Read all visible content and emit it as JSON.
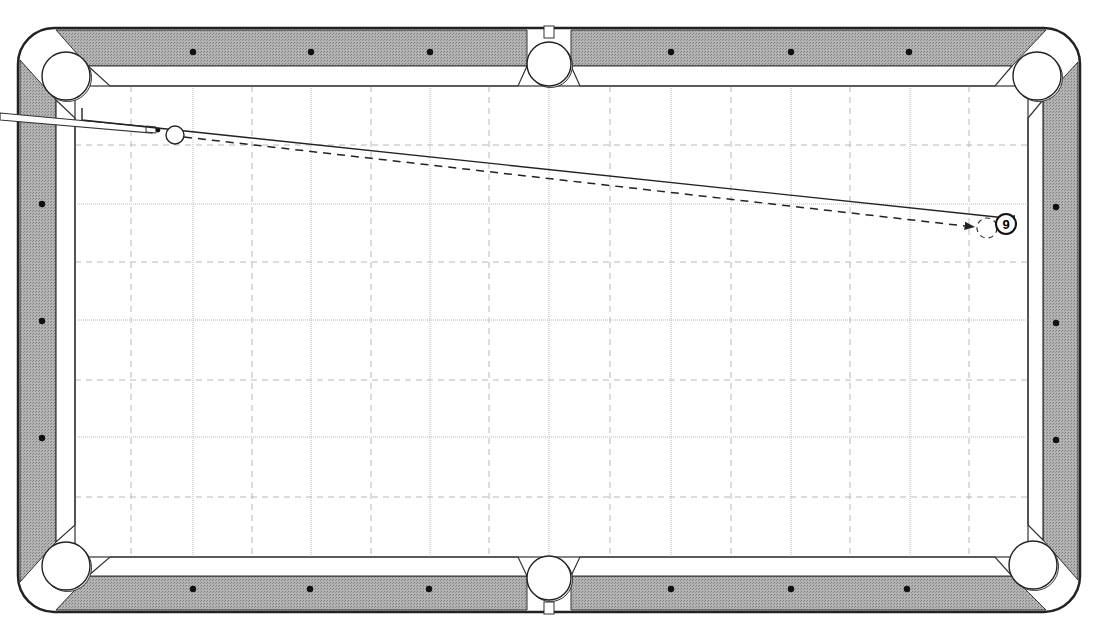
{
  "diagram": {
    "type": "pool-table-shot-diagram",
    "colors": {
      "rail": "#a9a9a9",
      "rail_outline": "#222222",
      "cloth": "#ffffff",
      "grid_line": "#b8b8b8",
      "diamond": "#111111",
      "path": "#222222"
    },
    "table": {
      "outer": {
        "x": 18,
        "y": 28,
        "width": 1062,
        "height": 584
      },
      "playfield": {
        "x": 75,
        "y": 86,
        "width": 953,
        "height": 471
      }
    },
    "pockets": [
      {
        "name": "top-left",
        "cx": 66,
        "cy": 76,
        "r": 24
      },
      {
        "name": "top-middle",
        "cx": 549,
        "cy": 64,
        "r": 22
      },
      {
        "name": "top-right",
        "cx": 1037,
        "cy": 76,
        "r": 24
      },
      {
        "name": "bottom-left",
        "cx": 66,
        "cy": 566,
        "r": 24
      },
      {
        "name": "bottom-middle",
        "cx": 549,
        "cy": 578,
        "r": 22
      },
      {
        "name": "bottom-right",
        "cx": 1033,
        "cy": 565,
        "r": 24
      }
    ],
    "diamonds": {
      "top": [
        193,
        311,
        430,
        671,
        791,
        909
      ],
      "bottom": [
        193,
        310,
        429,
        671,
        791,
        907
      ],
      "left": [
        204,
        321,
        438
      ],
      "right": [
        207,
        323,
        440
      ]
    },
    "grid": {
      "major_x": [
        193,
        311,
        430,
        549,
        671,
        791,
        910
      ],
      "minor_x": [
        131,
        252,
        371,
        489,
        610,
        731,
        850,
        969
      ],
      "major_y": [
        204,
        320,
        437
      ],
      "minor_y": [
        145,
        262,
        380,
        497
      ]
    },
    "balls": {
      "cue_ball": {
        "cx": 175,
        "cy": 135,
        "r": 9,
        "label": ""
      },
      "object_ball": {
        "cx": 1006,
        "cy": 224,
        "r": 10,
        "label": "9"
      },
      "ghost_ball": {
        "cx": 987,
        "cy": 228,
        "r": 10,
        "label": ""
      }
    },
    "paths": {
      "aim_line": {
        "points": [
          [
            82,
            108
          ],
          [
            82,
            120
          ],
          [
            1006,
            218
          ]
        ],
        "style": "solid"
      },
      "cue_ball_path": {
        "from": [
          184,
          137
        ],
        "to": [
          974,
          227
        ],
        "style": "dashed"
      }
    },
    "cue_stick": {
      "tip": [
        158,
        131
      ],
      "butt": [
        0,
        116
      ]
    }
  }
}
